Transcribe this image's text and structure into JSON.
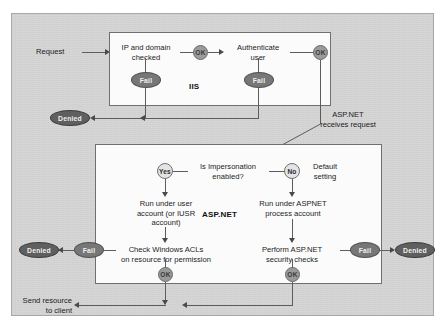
{
  "diagram": {
    "colors": {
      "page_background": "#ffffff",
      "panel_background": "#d5d5d5",
      "zone_background": "#fbfbfb",
      "zone_border": "#6f6f6f",
      "connector": "#5c5c5c",
      "ok_node_fill": "#9a9a9a",
      "decision_node_fill": "#e4e4e4",
      "fail_node_fill": "#777777",
      "denied_node_fill": "#5f5f5f",
      "text": "#1b1b1b"
    },
    "zones": [
      {
        "id": "iis",
        "label": "IIS"
      },
      {
        "id": "aspnet",
        "label": "ASP.NET"
      }
    ],
    "entry": {
      "label": "Request"
    },
    "iis_flow": {
      "step1": {
        "label": "IP and domain\ncheked"
      },
      "step1_text": "IP and domain\nchecked",
      "step1_ok": {
        "label": "OK"
      },
      "step1_fail": {
        "label": "Fail"
      },
      "step2_text": "Authenticate\nuser",
      "step2_ok": {
        "label": "OK"
      },
      "step2_fail": {
        "label": "Fail"
      }
    },
    "denied_top": {
      "label": "Denied"
    },
    "handoff_note": "ASP.NET\nreceives request",
    "aspnet_flow": {
      "decision_text": "Is Impersonation\nenabled?",
      "yes_node": {
        "label": "Yes"
      },
      "no_node": {
        "label": "No"
      },
      "default_setting_note": "Default\nsetting",
      "left_branch_text": "Run under user\naccount (or IUSR\naccount)",
      "right_branch_text": "Run under ASPNET\nprocess account",
      "left_check_text": "Check Windows ACLs\non resource for permission",
      "right_check_text": "Perform ASP.NET\nsecurity checks",
      "left_fail": {
        "label": "Fail"
      },
      "right_fail": {
        "label": "Fail"
      },
      "left_denied": {
        "label": "Denied"
      },
      "right_denied": {
        "label": "Denied"
      },
      "left_ok": {
        "label": "OK"
      },
      "right_ok": {
        "label": "OK"
      }
    },
    "exit": {
      "label": "Send resource\nto client"
    }
  }
}
